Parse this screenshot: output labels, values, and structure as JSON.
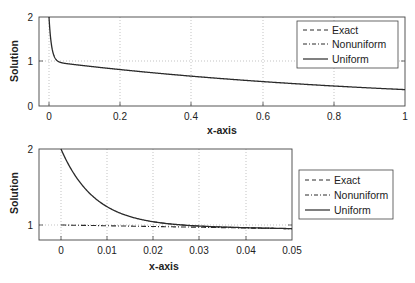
{
  "chart_data": [
    {
      "type": "line",
      "title": "",
      "xlabel": "x-axis",
      "ylabel": "Solution",
      "xlim": [
        -0.03,
        1
      ],
      "ylim": [
        0,
        2
      ],
      "xticks": [
        "0",
        "0.2",
        "0.4",
        "0.6",
        "0.8",
        "1"
      ],
      "yticks": [
        "0",
        "1",
        "2"
      ],
      "grid": true,
      "legend_position": "upper right",
      "series": [
        {
          "name": "Exact",
          "style": "dashed"
        },
        {
          "name": "Nonuniform",
          "style": "dash-dot"
        },
        {
          "name": "Uniform",
          "style": "solid"
        }
      ],
      "x": [
        0,
        0.005,
        0.01,
        0.02,
        0.05,
        0.1,
        0.2,
        0.4,
        0.6,
        0.8,
        1.0
      ],
      "values": [
        2.0,
        1.49,
        1.23,
        1.04,
        0.95,
        0.9,
        0.82,
        0.67,
        0.55,
        0.45,
        0.37
      ]
    },
    {
      "type": "line",
      "title": "",
      "xlabel": "x-axis",
      "ylabel": "Solution",
      "xlim": [
        -0.005,
        0.05
      ],
      "ylim": [
        0.8,
        2
      ],
      "xticks": [
        "0",
        "0.01",
        "0.02",
        "0.03",
        "0.04",
        "0.05"
      ],
      "yticks": [
        "1",
        "2"
      ],
      "grid": true,
      "legend_position": "outside right",
      "series": [
        {
          "name": "Exact",
          "style": "dashed"
        },
        {
          "name": "Nonuniform",
          "style": "dash-dot"
        },
        {
          "name": "Uniform",
          "style": "solid"
        }
      ],
      "x": [
        0,
        0.005,
        0.01,
        0.02,
        0.03,
        0.04,
        0.05
      ],
      "values": [
        2.0,
        1.49,
        1.23,
        1.04,
        0.99,
        0.97,
        0.95
      ]
    }
  ],
  "top": {
    "ylabel": "Solution",
    "xlabel": "x-axis",
    "xticks": [
      "0",
      "0.2",
      "0.4",
      "0.6",
      "0.8",
      "1"
    ],
    "yticks": [
      "0",
      "1",
      "2"
    ],
    "legend": [
      "Exact",
      "Nonuniform",
      "Uniform"
    ]
  },
  "bottom": {
    "ylabel": "Solution",
    "xlabel": "x-axis",
    "xticks": [
      "0",
      "0.01",
      "0.02",
      "0.03",
      "0.04",
      "0.05"
    ],
    "yticks": [
      "1",
      "2"
    ],
    "legend": [
      "Exact",
      "Nonuniform",
      "Uniform"
    ]
  },
  "colors": {
    "line": "#2a2a2a",
    "grid": "#9a9a9a",
    "frame": "#444444"
  }
}
